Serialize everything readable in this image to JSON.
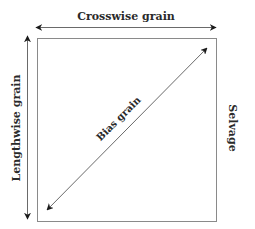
{
  "diagram": {
    "labels": {
      "crosswise": "Crosswise grain",
      "lengthwise": "Lengthwise grain",
      "bias": "Bias grain",
      "selvage": "Selvage"
    },
    "colors": {
      "box_stroke": "#8a8a8a",
      "arrow_stroke": "#6a6a6a",
      "arrow_head": "#1a1a1a",
      "text": "#2a2a2a",
      "background": "#ffffff"
    }
  }
}
